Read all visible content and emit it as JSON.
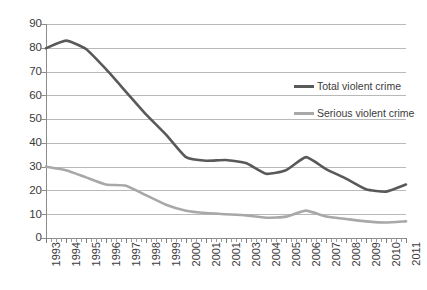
{
  "chart_data": {
    "type": "line",
    "title": "",
    "subtitle": "",
    "xlabel": "",
    "ylabel": "",
    "ylim": [
      0,
      90
    ],
    "ytick_step": 10,
    "yticks": [
      "0",
      "10",
      "20",
      "30",
      "40",
      "50",
      "60",
      "70",
      "80",
      "90"
    ],
    "grid": true,
    "legend_position": "inside-right-upper",
    "categories": [
      "1993",
      "1994",
      "1995",
      "1996",
      "1997",
      "1998",
      "1999",
      "2000",
      "2001",
      "2001",
      "2003",
      "2004",
      "2005",
      "2006",
      "2007",
      "2008",
      "2009",
      "2010",
      "2011"
    ],
    "x": [
      1993,
      1994,
      1995,
      1996,
      1997,
      1998,
      1999,
      2000,
      2001,
      2002,
      2003,
      2004,
      2005,
      2006,
      2007,
      2008,
      2009,
      2010,
      2011
    ],
    "series": [
      {
        "name": "Total violent crime",
        "color": "#595959",
        "values": [
          79.8,
          83.0,
          79.5,
          71.0,
          61.5,
          52.0,
          43.5,
          34.0,
          32.5,
          32.8,
          31.5,
          27.0,
          28.5,
          34.0,
          29.0,
          25.0,
          20.5,
          19.5,
          22.5
        ]
      },
      {
        "name": "Serious violent crime",
        "color": "#a8a8a8",
        "values": [
          30.0,
          28.5,
          25.5,
          22.5,
          22.0,
          18.0,
          14.0,
          11.5,
          10.5,
          10.0,
          9.5,
          8.5,
          9.0,
          11.5,
          9.0,
          8.0,
          7.0,
          6.5,
          7.0
        ]
      }
    ],
    "annotations": []
  },
  "legend": {
    "items": [
      {
        "label": "Total violent crime"
      },
      {
        "label": "Serious violent crime"
      }
    ]
  }
}
